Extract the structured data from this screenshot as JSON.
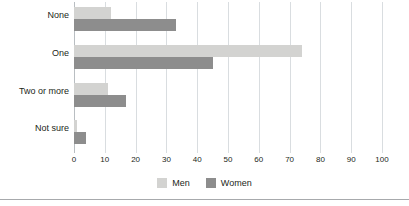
{
  "chart_data": {
    "type": "bar",
    "orientation": "horizontal",
    "title": "",
    "xlabel": "",
    "ylabel": "",
    "categories": [
      "None",
      "One",
      "Two or more",
      "Not sure"
    ],
    "series": [
      {
        "name": "Men",
        "color": "#d3d3d1",
        "values": [
          12,
          74,
          11,
          1
        ]
      },
      {
        "name": "Women",
        "color": "#8d8d8d",
        "values": [
          33,
          45,
          17,
          4
        ]
      }
    ],
    "xlim": [
      0,
      100
    ],
    "xticks": [
      0,
      10,
      20,
      30,
      40,
      50,
      60,
      70,
      80,
      90,
      100
    ],
    "xtick_labels": [
      "0",
      "10",
      "20",
      "30",
      "40",
      "50",
      "60",
      "70",
      "80",
      "90",
      "100"
    ],
    "grid": true,
    "grid_axis": "x",
    "legend_position": "bottom",
    "legend": [
      {
        "label": "Men",
        "color": "#d3d3d1"
      },
      {
        "label": "Women",
        "color": "#8d8d8d"
      }
    ]
  },
  "colors": {
    "men": "#d3d3d1",
    "women": "#8d8d8d",
    "gridline": "#d9dde0",
    "axis": "#b9bec2",
    "text": "#231f20",
    "rule": "#a7a9ac",
    "background": "#ffffff"
  }
}
